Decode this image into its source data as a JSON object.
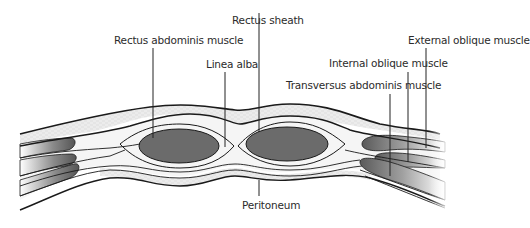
{
  "diagram": {
    "labels": {
      "rectus_sheath": "Rectus sheath",
      "rectus_abdominis": "Rectus abdominis muscle",
      "linea_alba": "Linea alba",
      "external_oblique": "External oblique muscle",
      "internal_oblique": "Internal oblique muscle",
      "transversus_abdominis": "Transversus abdominis muscle",
      "peritoneum": "Peritoneum"
    },
    "colors": {
      "outline": "#1a1a1a",
      "muscle_fill": "#6b6b6b",
      "fat_layer": "#e6e6e6",
      "sheath": "#f4f4f4",
      "leader_line": "#222222",
      "text": "#2b2b2b"
    }
  }
}
